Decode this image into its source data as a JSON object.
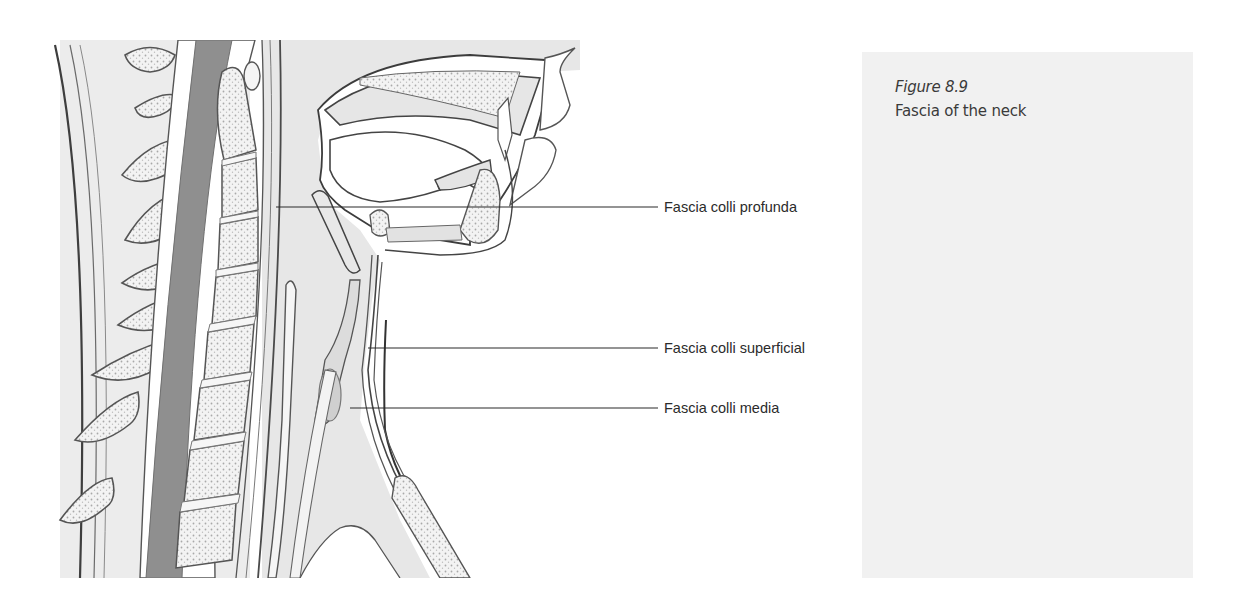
{
  "figure": {
    "number": "Figure 8.9",
    "title": "Fascia of the neck",
    "labels": [
      {
        "id": "profunda",
        "text": "Fascia colli profunda"
      },
      {
        "id": "superficial",
        "text": "Fascia colli superficial"
      },
      {
        "id": "media",
        "text": "Fascia colli media"
      }
    ]
  },
  "colors": {
    "outline": "#4a4a4a",
    "tissue_fill": "#e6e6e6",
    "bone_fill": "#f0f0f0",
    "spinal_cord": "#8f8f8f",
    "caption_bg": "#f1f1f1",
    "label_text": "#2b2b2b"
  }
}
